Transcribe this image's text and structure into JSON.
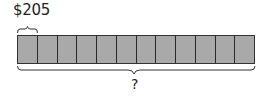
{
  "diagram": {
    "type": "tape-diagram",
    "unit_label": "$205",
    "segment_count": 12,
    "segments": [
      "",
      "",
      "",
      "",
      "",
      "",
      "",
      "",
      "",
      "",
      "",
      ""
    ],
    "total_label": "?",
    "segment_fill": "#a9a9a9",
    "divider_color": "#2a2a2a"
  }
}
